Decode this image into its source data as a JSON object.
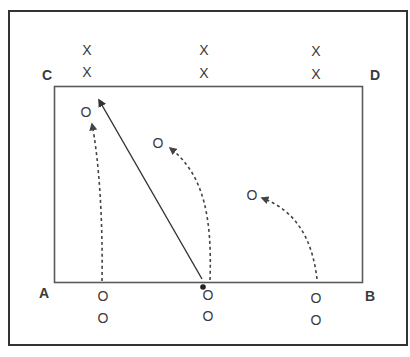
{
  "diagram": {
    "type": "sports-drill",
    "colors": {
      "stroke": "#333333",
      "inner_field": "#555555",
      "dashed": "#444444",
      "text": "#3a3a3a",
      "background": "#ffffff"
    },
    "corners": [
      {
        "label": "A",
        "x": 44,
        "y": 293
      },
      {
        "label": "B",
        "x": 370,
        "y": 296
      },
      {
        "label": "C",
        "x": 47,
        "y": 75
      },
      {
        "label": "D",
        "x": 375,
        "y": 75
      }
    ],
    "defenders": [
      {
        "label": "X",
        "x": 87,
        "y": 50
      },
      {
        "label": "X",
        "x": 87,
        "y": 72
      },
      {
        "label": "X",
        "x": 204,
        "y": 50
      },
      {
        "label": "X",
        "x": 204,
        "y": 73
      },
      {
        "label": "X",
        "x": 316,
        "y": 51
      },
      {
        "label": "X",
        "x": 316,
        "y": 74
      }
    ],
    "attackers_start": [
      {
        "label": "O",
        "x": 103,
        "y": 296
      },
      {
        "label": "O",
        "x": 103,
        "y": 318
      },
      {
        "label": "O",
        "x": 208,
        "y": 295
      },
      {
        "label": "O",
        "x": 208,
        "y": 316
      },
      {
        "label": "O",
        "x": 316,
        "y": 298
      },
      {
        "label": "O",
        "x": 316,
        "y": 320
      }
    ],
    "attackers_target": [
      {
        "label": "O",
        "x": 86,
        "y": 112
      },
      {
        "label": "O",
        "x": 158,
        "y": 143
      },
      {
        "label": "O",
        "x": 252,
        "y": 195
      }
    ],
    "ball": {
      "x": 203,
      "y": 287
    }
  }
}
